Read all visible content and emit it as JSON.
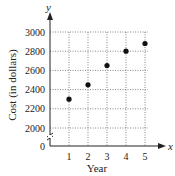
{
  "chart_data": {
    "type": "scatter",
    "title": "",
    "xlabel": "Year",
    "ylabel": "Cost (in dollars)",
    "x_axis_var": "x",
    "y_axis_var": "y",
    "x": [
      1,
      2,
      3,
      4,
      5
    ],
    "values": [
      2300,
      2450,
      2650,
      2800,
      2880
    ],
    "x_ticks": [
      "1",
      "2",
      "3",
      "4",
      "5"
    ],
    "y_ticks": [
      "0",
      "2000",
      "2200",
      "2400",
      "2600",
      "2800",
      "3000"
    ],
    "xlim": [
      0,
      5.5
    ],
    "ylim": [
      2000,
      3000
    ],
    "y_axis_break": true,
    "grid": true,
    "grid_style": "dotted",
    "legend": null,
    "marker_color": "#111111"
  }
}
